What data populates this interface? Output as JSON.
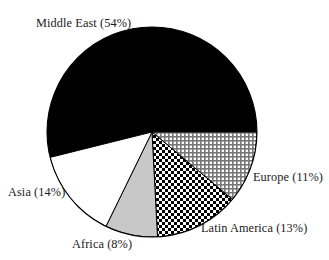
{
  "chart_data": {
    "type": "pie",
    "title": "",
    "subtitle": "",
    "xlabel": "",
    "ylabel": "",
    "legend_position": "none",
    "grid": false,
    "labels_format": "{name} ({value}%)",
    "total": 100,
    "units": "percent",
    "categories": [
      "Middle East",
      "Europe",
      "Latin America",
      "Africa",
      "Asia"
    ],
    "values": [
      54,
      11,
      13,
      8,
      14
    ],
    "slices": [
      {
        "name": "Middle East",
        "value": 54,
        "label": "Middle East (54%)",
        "fill_style": "solid-black",
        "fill_color": "#000000",
        "start_angle_deg": 166,
        "end_angle_deg": 360,
        "label_x": 36,
        "label_y": 18
      },
      {
        "name": "Europe",
        "value": 11,
        "label": "Europe (11%)",
        "fill_style": "fine-crosshatch",
        "fill_color": "#b4b4b4",
        "start_angle_deg": 0,
        "end_angle_deg": 40,
        "label_x": 253,
        "label_y": 172
      },
      {
        "name": "Latin America",
        "value": 13,
        "label": "Latin America (13%)",
        "fill_style": "checker-dots",
        "fill_color": "#ffffff",
        "start_angle_deg": 40,
        "end_angle_deg": 87,
        "label_x": 201,
        "label_y": 232
      },
      {
        "name": "Africa",
        "value": 8,
        "label": "Africa (8%)",
        "fill_style": "solid-gray",
        "fill_color": "#c8c8c8",
        "start_angle_deg": 87,
        "end_angle_deg": 116,
        "label_x": 72,
        "label_y": 248
      },
      {
        "name": "Asia",
        "value": 14,
        "label": "Asia (14%)",
        "fill_style": "solid-white",
        "fill_color": "#ffffff",
        "start_angle_deg": 116,
        "end_angle_deg": 166,
        "label_x": 8,
        "label_y": 196
      }
    ],
    "geometry": {
      "center_x": 152,
      "center_y": 132,
      "radius": 105,
      "outline_color": "#000000",
      "background": "#ffffff"
    }
  }
}
